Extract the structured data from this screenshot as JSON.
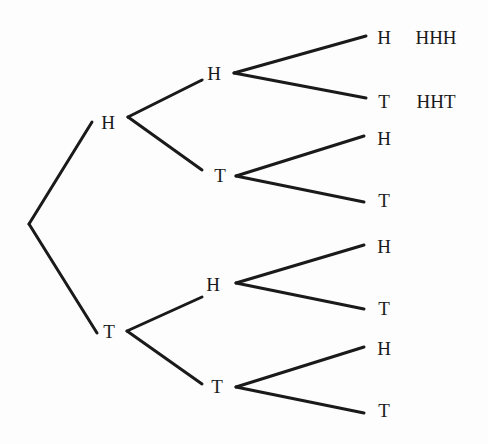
{
  "diagram": {
    "type": "probability-tree",
    "nodes": [
      {
        "id": "root",
        "label": "",
        "x": 29,
        "y": 224
      },
      {
        "id": "H",
        "label": "H",
        "x": 108,
        "y": 122
      },
      {
        "id": "T",
        "label": "T",
        "x": 109,
        "y": 331
      },
      {
        "id": "HH",
        "label": "H",
        "x": 214,
        "y": 73
      },
      {
        "id": "HT",
        "label": "T",
        "x": 220,
        "y": 175
      },
      {
        "id": "TH",
        "label": "H",
        "x": 213,
        "y": 284
      },
      {
        "id": "TT",
        "label": "T",
        "x": 217,
        "y": 386
      },
      {
        "id": "HHH",
        "label": "H",
        "x": 384,
        "y": 37
      },
      {
        "id": "HHT",
        "label": "T",
        "x": 384,
        "y": 101
      },
      {
        "id": "HTH",
        "label": "H",
        "x": 384,
        "y": 138
      },
      {
        "id": "HTT",
        "label": "T",
        "x": 384,
        "y": 200
      },
      {
        "id": "THH",
        "label": "H",
        "x": 384,
        "y": 246
      },
      {
        "id": "THT",
        "label": "T",
        "x": 384,
        "y": 308
      },
      {
        "id": "TTH",
        "label": "H",
        "x": 384,
        "y": 348
      },
      {
        "id": "TTT",
        "label": "T",
        "x": 384,
        "y": 410
      }
    ],
    "edges": [
      {
        "x1": 29,
        "y1": 224,
        "x2": 92,
        "y2": 122
      },
      {
        "x1": 29,
        "y1": 224,
        "x2": 97,
        "y2": 333
      },
      {
        "x1": 128,
        "y1": 117,
        "x2": 202,
        "y2": 80
      },
      {
        "x1": 128,
        "y1": 117,
        "x2": 202,
        "y2": 170
      },
      {
        "x1": 127,
        "y1": 331,
        "x2": 202,
        "y2": 297
      },
      {
        "x1": 127,
        "y1": 331,
        "x2": 202,
        "y2": 384
      },
      {
        "x1": 234,
        "y1": 73,
        "x2": 366,
        "y2": 36
      },
      {
        "x1": 234,
        "y1": 73,
        "x2": 366,
        "y2": 98
      },
      {
        "x1": 236,
        "y1": 176,
        "x2": 364,
        "y2": 136
      },
      {
        "x1": 236,
        "y1": 176,
        "x2": 364,
        "y2": 202
      },
      {
        "x1": 236,
        "y1": 283,
        "x2": 364,
        "y2": 245
      },
      {
        "x1": 236,
        "y1": 283,
        "x2": 364,
        "y2": 309
      },
      {
        "x1": 236,
        "y1": 387,
        "x2": 364,
        "y2": 347
      },
      {
        "x1": 236,
        "y1": 387,
        "x2": 364,
        "y2": 413
      }
    ],
    "outcomes": [
      {
        "label": "HHH",
        "x": 436,
        "y": 37
      },
      {
        "label": "HHT",
        "x": 436,
        "y": 101
      }
    ]
  }
}
